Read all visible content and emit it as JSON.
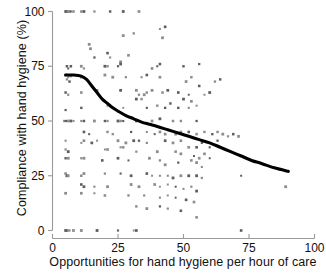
{
  "chart_data": {
    "type": "scatter",
    "title": "",
    "xlabel": "Opportunities for hand hygiene per hour of care",
    "ylabel": "Compliance with hand hygiene (%)",
    "xlim": [
      0,
      100
    ],
    "ylim": [
      0,
      100
    ],
    "xticks": [
      0,
      25,
      50,
      75,
      100
    ],
    "yticks": [
      0,
      25,
      50,
      75,
      100
    ],
    "xtick_labels": [
      "0",
      "25",
      "50",
      "75",
      "100"
    ],
    "ytick_labels": [
      "0",
      "25",
      "50",
      "75",
      "100"
    ],
    "grid": false,
    "legend": null,
    "marker": "small-gray-square",
    "marker_color": "#8d8d8d",
    "points": [
      [
        5,
        100
      ],
      [
        5.5,
        100
      ],
      [
        6,
        100
      ],
      [
        6.5,
        100
      ],
      [
        7,
        100
      ],
      [
        8,
        100
      ],
      [
        11,
        100
      ],
      [
        12,
        100
      ],
      [
        16,
        100
      ],
      [
        22,
        100
      ],
      [
        27,
        100
      ],
      [
        33,
        100
      ],
      [
        14,
        85
      ],
      [
        14.5,
        83
      ],
      [
        21,
        81
      ],
      [
        16,
        79
      ],
      [
        22,
        79
      ],
      [
        29,
        80
      ],
      [
        41,
        92
      ],
      [
        43,
        93
      ],
      [
        42,
        88
      ],
      [
        27,
        89
      ],
      [
        31,
        90
      ],
      [
        26,
        77
      ],
      [
        5.5,
        75
      ],
      [
        7,
        75
      ],
      [
        6,
        74
      ],
      [
        11,
        75
      ],
      [
        12,
        74
      ],
      [
        20,
        75
      ],
      [
        21,
        75
      ],
      [
        25,
        75
      ],
      [
        26,
        76
      ],
      [
        38,
        74
      ],
      [
        40,
        75
      ],
      [
        41,
        76
      ],
      [
        50,
        75
      ],
      [
        56,
        76
      ],
      [
        5,
        71
      ],
      [
        6,
        70
      ],
      [
        7,
        70.5
      ],
      [
        5.5,
        69
      ],
      [
        6.5,
        68
      ],
      [
        11,
        70
      ],
      [
        20,
        71
      ],
      [
        23,
        70
      ],
      [
        28,
        70
      ],
      [
        34,
        70
      ],
      [
        36,
        71
      ],
      [
        41,
        70
      ],
      [
        51,
        68
      ],
      [
        53,
        70
      ],
      [
        62,
        68
      ],
      [
        64,
        69
      ],
      [
        56,
        66
      ],
      [
        5,
        63
      ],
      [
        6,
        62
      ],
      [
        11,
        63
      ],
      [
        17,
        64
      ],
      [
        26,
        64
      ],
      [
        32,
        64
      ],
      [
        33,
        62
      ],
      [
        35,
        62
      ],
      [
        36,
        63
      ],
      [
        38,
        64
      ],
      [
        42,
        63
      ],
      [
        44,
        64
      ],
      [
        48,
        63
      ],
      [
        52,
        62
      ],
      [
        58,
        62
      ],
      [
        60,
        63
      ],
      [
        50,
        60
      ],
      [
        53,
        59
      ],
      [
        32,
        60
      ],
      [
        34,
        60
      ],
      [
        5,
        55
      ],
      [
        11,
        56
      ],
      [
        21,
        57
      ],
      [
        27,
        56
      ],
      [
        36,
        56
      ],
      [
        40,
        57
      ],
      [
        43,
        56
      ],
      [
        45,
        58
      ],
      [
        48,
        56
      ],
      [
        52,
        56
      ],
      [
        55,
        57
      ],
      [
        4.5,
        50
      ],
      [
        5,
        50
      ],
      [
        5.5,
        50
      ],
      [
        6,
        50
      ],
      [
        7,
        50
      ],
      [
        8,
        50
      ],
      [
        11,
        50
      ],
      [
        12,
        50
      ],
      [
        16,
        50
      ],
      [
        20,
        50
      ],
      [
        21,
        50
      ],
      [
        25,
        50
      ],
      [
        26,
        50
      ],
      [
        27,
        50
      ],
      [
        32,
        50
      ],
      [
        33,
        50
      ],
      [
        38,
        50
      ],
      [
        41,
        51
      ],
      [
        46,
        50
      ],
      [
        49,
        50
      ],
      [
        55,
        50
      ],
      [
        12,
        45
      ],
      [
        14,
        44
      ],
      [
        21,
        45
      ],
      [
        23,
        44
      ],
      [
        30,
        45
      ],
      [
        36,
        45
      ],
      [
        39,
        44
      ],
      [
        41,
        45
      ],
      [
        43,
        44
      ],
      [
        47,
        44
      ],
      [
        49,
        45
      ],
      [
        52,
        45
      ],
      [
        55,
        44
      ],
      [
        58,
        45
      ],
      [
        61,
        44
      ],
      [
        63,
        45
      ],
      [
        65,
        44
      ],
      [
        67,
        43
      ],
      [
        69,
        44
      ],
      [
        71,
        43
      ],
      [
        5,
        41
      ],
      [
        11,
        40
      ],
      [
        12,
        41
      ],
      [
        15,
        40
      ],
      [
        17,
        41
      ],
      [
        25,
        41
      ],
      [
        28,
        40
      ],
      [
        31,
        41
      ],
      [
        33,
        41
      ],
      [
        36,
        40
      ],
      [
        43,
        41
      ],
      [
        46,
        40
      ],
      [
        49,
        41
      ],
      [
        52,
        38
      ],
      [
        55,
        38
      ],
      [
        57,
        40
      ],
      [
        60,
        38
      ],
      [
        63,
        41
      ],
      [
        5,
        37
      ],
      [
        6,
        36
      ],
      [
        20,
        37
      ],
      [
        21,
        37
      ],
      [
        26,
        38
      ],
      [
        27,
        38
      ],
      [
        32,
        36
      ],
      [
        40,
        36
      ],
      [
        47,
        36
      ],
      [
        49,
        35
      ],
      [
        54,
        34
      ],
      [
        56,
        33
      ],
      [
        58,
        35
      ],
      [
        60,
        33
      ],
      [
        5,
        33
      ],
      [
        6,
        33
      ],
      [
        11,
        33
      ],
      [
        12,
        33
      ],
      [
        19,
        32
      ],
      [
        25,
        33
      ],
      [
        29,
        32
      ],
      [
        37,
        33
      ],
      [
        41,
        32
      ],
      [
        43,
        30
      ],
      [
        48,
        31
      ],
      [
        53,
        32
      ],
      [
        55,
        31
      ],
      [
        57,
        29
      ],
      [
        5,
        26
      ],
      [
        5.5,
        25
      ],
      [
        6,
        25
      ],
      [
        11,
        25
      ],
      [
        12,
        26
      ],
      [
        20,
        26
      ],
      [
        26,
        26
      ],
      [
        30,
        25
      ],
      [
        36,
        26
      ],
      [
        38,
        25
      ],
      [
        41,
        25
      ],
      [
        44,
        25
      ],
      [
        46,
        24
      ],
      [
        49,
        25
      ],
      [
        52,
        25
      ],
      [
        55,
        25
      ],
      [
        57,
        24
      ],
      [
        72,
        25
      ],
      [
        89,
        20
      ],
      [
        11,
        21
      ],
      [
        12,
        20
      ],
      [
        16,
        20
      ],
      [
        21,
        20
      ],
      [
        30,
        21
      ],
      [
        33,
        20
      ],
      [
        39,
        21
      ],
      [
        41,
        20
      ],
      [
        44,
        21
      ],
      [
        47,
        20
      ],
      [
        50,
        19
      ],
      [
        53,
        20
      ],
      [
        55,
        18
      ],
      [
        5,
        17
      ],
      [
        11,
        17
      ],
      [
        16,
        17
      ],
      [
        20,
        16
      ],
      [
        29,
        16
      ],
      [
        35,
        16
      ],
      [
        41,
        15
      ],
      [
        44,
        16
      ],
      [
        47,
        15
      ],
      [
        51,
        14
      ],
      [
        54,
        13
      ],
      [
        32,
        11
      ],
      [
        36,
        10
      ],
      [
        41,
        11
      ],
      [
        44,
        10
      ],
      [
        49,
        9
      ],
      [
        55,
        6
      ],
      [
        5,
        0
      ],
      [
        5.5,
        0
      ],
      [
        6,
        0
      ],
      [
        6.5,
        0
      ],
      [
        8,
        0
      ],
      [
        11,
        0
      ],
      [
        17,
        0
      ],
      [
        25,
        0
      ],
      [
        31,
        0
      ],
      [
        32,
        0
      ],
      [
        72,
        0
      ]
    ],
    "trend_line": {
      "name": "LOESS smoothed trend",
      "color": "#000000",
      "points": [
        [
          5,
          71
        ],
        [
          8,
          71
        ],
        [
          11,
          70.5
        ],
        [
          13,
          69
        ],
        [
          15,
          66
        ],
        [
          17,
          63
        ],
        [
          19,
          60
        ],
        [
          21,
          58
        ],
        [
          23,
          56
        ],
        [
          25,
          54.5
        ],
        [
          28,
          52.5
        ],
        [
          31,
          51
        ],
        [
          34,
          49.5
        ],
        [
          37,
          48.5
        ],
        [
          40,
          47.5
        ],
        [
          44,
          46
        ],
        [
          48,
          44.5
        ],
        [
          52,
          43
        ],
        [
          56,
          41.5
        ],
        [
          60,
          40
        ],
        [
          64,
          38
        ],
        [
          68,
          36
        ],
        [
          72,
          34
        ],
        [
          76,
          32
        ],
        [
          80,
          30.5
        ],
        [
          85,
          28.5
        ],
        [
          90,
          27
        ]
      ]
    }
  }
}
